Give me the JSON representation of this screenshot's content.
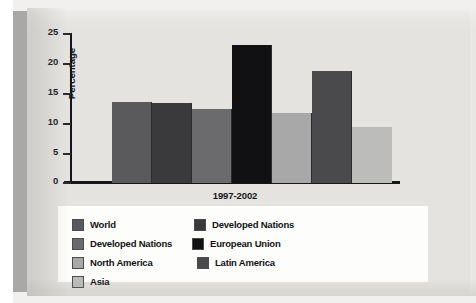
{
  "chart_data": {
    "type": "bar",
    "title": "",
    "subtitle": "",
    "xlabel": "1997-2002",
    "ylabel": "Percentage",
    "ylim": [
      0,
      25
    ],
    "yticks": [
      25,
      20,
      15,
      10,
      5,
      0
    ],
    "grid": false,
    "legend_position": "bottom",
    "categories": [
      "World",
      "Developed Nations",
      "Developed Nations",
      "European Union",
      "North America",
      "Latin America",
      "Asia"
    ],
    "values": [
      13.5,
      13.4,
      12.4,
      23.0,
      11.6,
      18.7,
      9.4
    ],
    "colors": [
      "#5a5a5c",
      "#3a3a3d",
      "#6b6b6d",
      "#111113",
      "#a8a8a8",
      "#4a4a4d",
      "#bcbcbb"
    ],
    "annotations": []
  },
  "legend": {
    "items": [
      {
        "label": "World",
        "color": "#5a5a5c",
        "column": 1
      },
      {
        "label": "Developed Nations",
        "color": "#3a3a3d",
        "column": 2
      },
      {
        "label": "Developed Nations",
        "color": "#6b6b6d",
        "column": 3
      },
      {
        "label": "European Union",
        "color": "#111113",
        "column": 1
      },
      {
        "label": "North America",
        "color": "#a8a8a8",
        "column": 2
      },
      {
        "label": "Latin America",
        "color": "#4a4a4d",
        "column": 3
      },
      {
        "label": "Asia",
        "color": "#bcbcbb",
        "column": 1
      }
    ]
  }
}
